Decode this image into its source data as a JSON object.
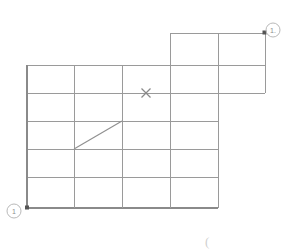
{
  "figure": {
    "background_color": "#ffffff",
    "line_color": "#9a9a9a",
    "accent_color": "#555555",
    "width": 296,
    "height": 251
  },
  "markers": {
    "top_right_callout": {
      "label": "1.",
      "cx": 273,
      "cy": 30,
      "r": 7,
      "node_x": 265,
      "node_y": 33
    },
    "bottom_left_callout": {
      "label": "1",
      "cx": 14,
      "cy": 211,
      "r": 7,
      "node_x": 27,
      "node_y": 208
    },
    "cross_marker": {
      "label": "x-mark",
      "x": 146,
      "y": 93,
      "size": 5
    },
    "corner_glyph": {
      "label": "(",
      "x": 205,
      "y": 245
    }
  },
  "grid": {
    "vertical_positions": [
      27,
      74,
      122,
      170,
      218
    ],
    "horizontal_positions": [
      65,
      93,
      121,
      149,
      177,
      208
    ],
    "extension": {
      "left": 170,
      "right": 265,
      "top": 33,
      "divider_x": 218,
      "bottom_left_col": 93,
      "bottom_right_col": 93
    }
  },
  "diagonal": {
    "x1": 74,
    "y1": 149,
    "x2": 122,
    "y2": 121
  }
}
